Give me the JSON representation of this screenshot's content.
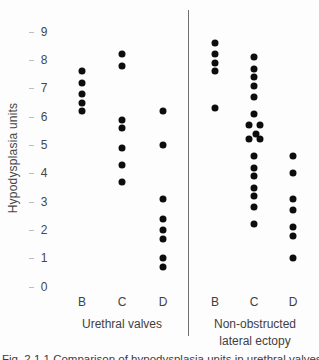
{
  "figure": {
    "caption": "Fig. 2.1.1  Comparison of hypodysplasia units in urethral valves and non-obstructed lateral ectopy."
  },
  "chart_data": {
    "type": "scatter",
    "variant": "dot-strip-plot",
    "title": "",
    "xlabel": "",
    "ylabel": "Hypodysplasia units",
    "ylim": [
      0,
      9
    ],
    "y_ticks": [
      9,
      8,
      7,
      6,
      5,
      4,
      3,
      2,
      1,
      0
    ],
    "grid": false,
    "legend": false,
    "groups": [
      {
        "label_lines": [
          "Urethral valves"
        ],
        "categories": [
          "B",
          "C",
          "D"
        ],
        "series": [
          {
            "name": "B",
            "values": [
              7.6,
              7.2,
              6.8,
              6.5,
              6.2
            ]
          },
          {
            "name": "C",
            "values": [
              8.2,
              7.8,
              5.9,
              5.6,
              4.9,
              4.3,
              3.7
            ]
          },
          {
            "name": "D",
            "values": [
              6.2,
              5.0,
              3.1,
              2.4,
              2.0,
              1.7,
              1.0,
              0.7
            ]
          }
        ]
      },
      {
        "label_lines": [
          "Non-obstructed",
          "lateral ectopy"
        ],
        "categories": [
          "B",
          "C",
          "D"
        ],
        "series": [
          {
            "name": "B",
            "values": [
              8.6,
              8.2,
              7.9,
              7.6,
              6.3
            ]
          },
          {
            "name": "C",
            "values": [
              8.1,
              7.7,
              7.4,
              7.1,
              6.7,
              6.1,
              5.7,
              5.7,
              5.4,
              5.2,
              5.2,
              4.6,
              4.2,
              3.9,
              3.5,
              3.2,
              2.8,
              2.2
            ],
            "x_jitter": [
              0,
              0,
              0,
              0,
              0,
              0,
              -5.5,
              5.5,
              1.5,
              -5.5,
              5.5,
              0,
              0,
              0,
              0,
              0,
              0,
              0
            ]
          },
          {
            "name": "D",
            "values": [
              4.6,
              4.0,
              3.1,
              2.7,
              2.1,
              1.8,
              1.0
            ]
          }
        ]
      }
    ],
    "appearance": {
      "dot_color": "#0d0d0d",
      "text_color": "#474747",
      "divider_color": "#6f6f6f",
      "background": "#fdfdfd"
    }
  }
}
